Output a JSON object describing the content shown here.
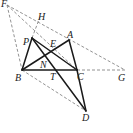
{
  "diagram": {
    "type": "geometry",
    "points": {
      "F": {
        "label": "F",
        "x": 7,
        "y": 5
      },
      "H": {
        "label": "H",
        "x": 38,
        "y": 18
      },
      "P": {
        "label": "P",
        "x": 32,
        "y": 38
      },
      "A": {
        "label": "A",
        "x": 69,
        "y": 40
      },
      "E": {
        "label": "E",
        "x": 52,
        "y": 47
      },
      "N": {
        "label": "N",
        "x": 45,
        "y": 58
      },
      "B": {
        "label": "B",
        "x": 22,
        "y": 70
      },
      "T": {
        "label": "T",
        "x": 57,
        "y": 70
      },
      "C": {
        "label": "C",
        "x": 77,
        "y": 70
      },
      "G": {
        "label": "G",
        "x": 125,
        "y": 70
      },
      "D": {
        "label": "D",
        "x": 86,
        "y": 111
      }
    },
    "solid_segments": [
      "PB",
      "BC",
      "BA",
      "PC",
      "PD",
      "AC",
      "CD"
    ],
    "dashed_segments": [
      "FB",
      "FG",
      "FC",
      "PH",
      "BD",
      "CG"
    ],
    "colors": {
      "line": "#1a1a1a",
      "dashed": "#777777",
      "label": "#222222"
    }
  }
}
